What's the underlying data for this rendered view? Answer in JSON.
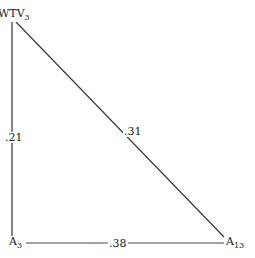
{
  "diagram": {
    "type": "triangle-path-diagram",
    "nodes": [
      {
        "id": "wtv3",
        "base": "WTV",
        "sub": "3",
        "x": 12,
        "y": 16
      },
      {
        "id": "a3",
        "base": "A",
        "sub": "3",
        "x": 12,
        "y": 243
      },
      {
        "id": "a13",
        "base": "A",
        "sub": "13",
        "x": 232,
        "y": 243
      }
    ],
    "edges": [
      {
        "from": "wtv3",
        "to": "a3",
        "label": ".21"
      },
      {
        "from": "wtv3",
        "to": "a13",
        "label": ".31"
      },
      {
        "from": "a3",
        "to": "a13",
        "label": ".38"
      }
    ],
    "line_color": "#333333",
    "text_color": "#222222"
  }
}
